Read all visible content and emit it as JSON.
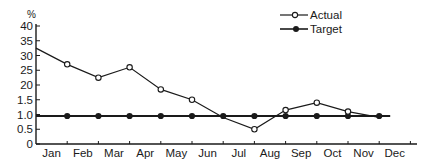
{
  "chart_data": {
    "type": "line",
    "title": "",
    "xlabel": "",
    "ylabel": "%",
    "categories": [
      "Jan",
      "Feb",
      "Mar",
      "Apr",
      "May",
      "Jun",
      "Jul",
      "Aug",
      "Sep",
      "Oct",
      "Nov",
      "Dec"
    ],
    "y_tick_labels": [
      "0",
      "0.5",
      "1.0",
      "1.5",
      "20",
      "25",
      "30",
      "35",
      "40"
    ],
    "y_tick_values": [
      0,
      0.5,
      1.0,
      1.5,
      2.0,
      2.5,
      3.0,
      3.5,
      4.0
    ],
    "ylim": [
      0,
      4.0
    ],
    "grid": false,
    "legend_position": "top-right",
    "series": [
      {
        "name": "Actual",
        "marker": "open-circle",
        "values": [
          3.25,
          2.7,
          2.25,
          2.6,
          1.85,
          1.5,
          0.9,
          0.5,
          1.15,
          1.4,
          1.1,
          0.9
        ]
      },
      {
        "name": "Target",
        "marker": "filled-circle",
        "values": [
          0.95,
          0.95,
          0.95,
          0.95,
          0.95,
          0.95,
          0.95,
          0.95,
          0.95,
          0.95,
          0.95,
          0.95
        ]
      }
    ]
  },
  "legend": {
    "actual_label": "Actual",
    "target_label": "Target"
  },
  "axis": {
    "unit_label": "%"
  },
  "colors": {
    "line": "#1a1a1a",
    "background": "#ffffff"
  }
}
